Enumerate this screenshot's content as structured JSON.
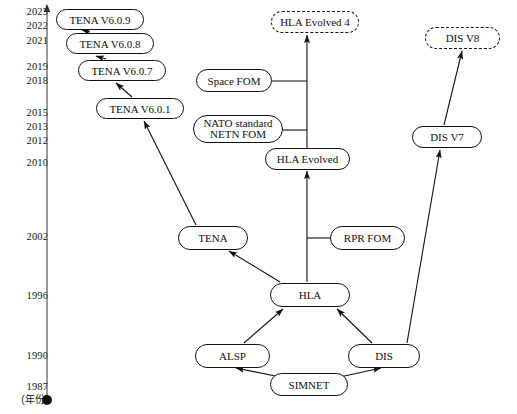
{
  "diagram": {
    "axis": {
      "name": "year-axis",
      "caption": "(年份)",
      "ticks": [
        {
          "label": "2023",
          "y": 11
        },
        {
          "label": "2022",
          "y": 25
        },
        {
          "label": "2021",
          "y": 40
        },
        {
          "label": "2019",
          "y": 66
        },
        {
          "label": "2018",
          "y": 80
        },
        {
          "label": "2015",
          "y": 112
        },
        {
          "label": "2013",
          "y": 126
        },
        {
          "label": "2012",
          "y": 140
        },
        {
          "label": "2010",
          "y": 162
        },
        {
          "label": "2002",
          "y": 236
        },
        {
          "label": "1996",
          "y": 295
        },
        {
          "label": "1990",
          "y": 355
        },
        {
          "label": "1987",
          "y": 387
        }
      ]
    },
    "nodes": [
      {
        "id": "tena609",
        "label": "TENA V6.0.9",
        "x": 56,
        "y": 9,
        "w": 88,
        "h": 21,
        "style": "solid"
      },
      {
        "id": "tena608",
        "label": "TENA V6.0.8",
        "x": 66,
        "y": 33,
        "w": 88,
        "h": 21,
        "style": "solid"
      },
      {
        "id": "tena607",
        "label": "TENA V6.0.7",
        "x": 78,
        "y": 60,
        "w": 88,
        "h": 21,
        "style": "solid"
      },
      {
        "id": "tena601",
        "label": "TENA V6.0.1",
        "x": 96,
        "y": 98,
        "w": 88,
        "h": 21,
        "style": "solid"
      },
      {
        "id": "hlaev4",
        "label": "HLA Evolved 4",
        "x": 271,
        "y": 11,
        "w": 88,
        "h": 22,
        "style": "dashed"
      },
      {
        "id": "disv8",
        "label": "DIS V8",
        "x": 425,
        "y": 27,
        "w": 75,
        "h": 22,
        "style": "dashed"
      },
      {
        "id": "spacefom",
        "label": "Space FOM",
        "x": 196,
        "y": 69,
        "w": 76,
        "h": 23,
        "style": "solid"
      },
      {
        "id": "netnfom",
        "label": "NATO standard NETN FOM",
        "line1": "NATO standard",
        "line2": "NETN FOM",
        "x": 193,
        "y": 115,
        "w": 90,
        "h": 28,
        "style": "solid"
      },
      {
        "id": "disv7",
        "label": "DIS V7",
        "x": 412,
        "y": 126,
        "w": 70,
        "h": 22,
        "style": "solid"
      },
      {
        "id": "hlaev",
        "label": "HLA Evolved",
        "x": 265,
        "y": 148,
        "w": 85,
        "h": 22,
        "style": "solid"
      },
      {
        "id": "tena",
        "label": "TENA",
        "x": 178,
        "y": 226,
        "w": 70,
        "h": 24,
        "style": "solid"
      },
      {
        "id": "rprfom",
        "label": "RPR FOM",
        "x": 330,
        "y": 226,
        "w": 75,
        "h": 24,
        "style": "solid"
      },
      {
        "id": "hla",
        "label": "HLA",
        "x": 270,
        "y": 283,
        "w": 80,
        "h": 24,
        "style": "solid"
      },
      {
        "id": "alsp",
        "label": "ALSP",
        "x": 195,
        "y": 344,
        "w": 75,
        "h": 24,
        "style": "solid"
      },
      {
        "id": "dis",
        "label": "DIS",
        "x": 348,
        "y": 344,
        "w": 72,
        "h": 24,
        "style": "solid"
      },
      {
        "id": "simnet",
        "label": "SIMNET",
        "x": 270,
        "y": 373,
        "w": 78,
        "h": 23,
        "style": "solid"
      }
    ],
    "edges": [
      {
        "from": "tena601",
        "to": "tena607",
        "kind": "arrow"
      },
      {
        "from": "tena607",
        "to": "tena608",
        "kind": "arrow"
      },
      {
        "from": "tena608",
        "to": "tena609",
        "kind": "arrow"
      },
      {
        "from": "tena",
        "to": "tena601",
        "kind": "arrow"
      },
      {
        "from": "hla",
        "to": "tena",
        "kind": "arrow"
      },
      {
        "from": "hla",
        "to": "hlaev",
        "kind": "arrow"
      },
      {
        "from": "hlaev",
        "to": "hlaev4",
        "kind": "arrow"
      },
      {
        "from": "spacefom",
        "to": "hla-evolved-stem",
        "kind": "line"
      },
      {
        "from": "netnfom",
        "to": "hla-evolved-stem",
        "kind": "line"
      },
      {
        "from": "rprfom",
        "to": "hla-evolved-stem",
        "kind": "line"
      },
      {
        "from": "alsp",
        "to": "hla",
        "kind": "arrow"
      },
      {
        "from": "dis",
        "to": "hla",
        "kind": "arrow"
      },
      {
        "from": "simnet",
        "to": "alsp",
        "kind": "arrow"
      },
      {
        "from": "simnet",
        "to": "dis",
        "kind": "arrow"
      },
      {
        "from": "dis",
        "to": "disv7",
        "kind": "arrow"
      },
      {
        "from": "disv7",
        "to": "disv8",
        "kind": "arrow"
      }
    ],
    "colors": {
      "stroke": "#111111",
      "background": "#ffffff",
      "text": "#161616"
    }
  }
}
